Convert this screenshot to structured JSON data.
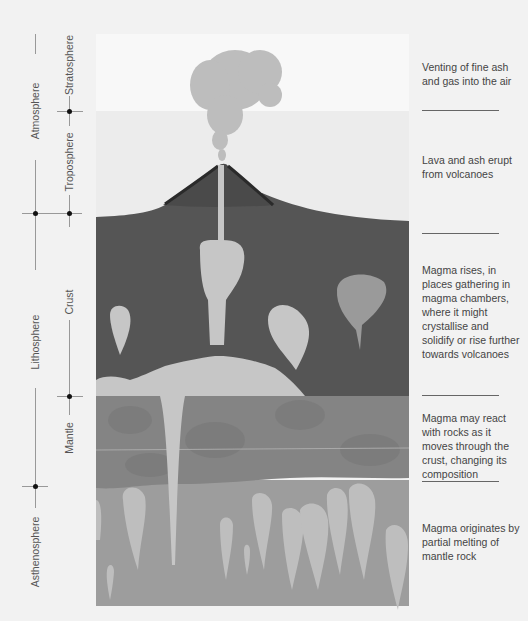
{
  "left_axis": {
    "outer": [
      {
        "label": "Atmosphere"
      },
      {
        "label": "Lithosphere"
      },
      {
        "label": "Asthenosphere"
      }
    ],
    "inner": [
      {
        "label": "Stratosphere"
      },
      {
        "label": "Troposphere"
      },
      {
        "label": "Crust"
      },
      {
        "label": "Mantle"
      }
    ]
  },
  "descriptions": [
    {
      "text": "Venting of fine ash and gas into the air"
    },
    {
      "text": "Lava and ash erupt from volcanoes"
    },
    {
      "text": "Magma rises, in places gathering in magma chambers, where it might crystallise and solidify or rise further towards volcanoes"
    },
    {
      "text": "Magma may react with rocks as it moves through the crust, changing its composition"
    },
    {
      "text": "Magma originates by partial melting of mantle rock"
    }
  ],
  "colors": {
    "background": "#f2f2f2",
    "stratosphere": "#f7f7f7",
    "troposphere": "#ebebeb",
    "crust": "#555555",
    "volcano": "#4a4a4a",
    "upper_mantle": "#8a8a8a",
    "asthenosphere": "#9c9c9c",
    "magma": "#c4c4c4",
    "ash": "#bdbdbd"
  }
}
